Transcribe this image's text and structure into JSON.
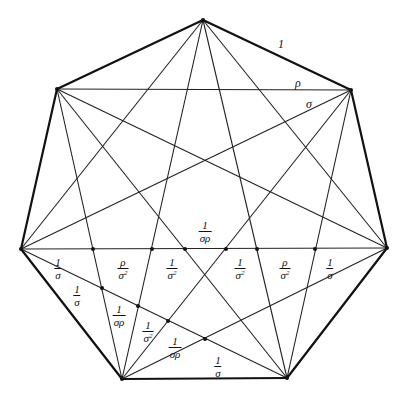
{
  "diagram": {
    "vertices": [
      {
        "id": "top",
        "x": 203,
        "y": 20
      },
      {
        "id": "upper-right",
        "x": 351,
        "y": 90
      },
      {
        "id": "right",
        "x": 387,
        "y": 248
      },
      {
        "id": "bottom-right",
        "x": 287,
        "y": 378
      },
      {
        "id": "bottom-left",
        "x": 122,
        "y": 379
      },
      {
        "id": "left",
        "x": 21,
        "y": 249
      },
      {
        "id": "upper-left",
        "x": 57,
        "y": 89
      }
    ],
    "intersection_dots": [
      {
        "x": 93,
        "y": 249
      },
      {
        "x": 152,
        "y": 249
      },
      {
        "x": 185,
        "y": 249
      },
      {
        "x": 226,
        "y": 249
      },
      {
        "x": 257,
        "y": 249
      },
      {
        "x": 315,
        "y": 249
      },
      {
        "x": 102,
        "y": 288
      },
      {
        "x": 138,
        "y": 306
      },
      {
        "x": 168,
        "y": 321
      },
      {
        "x": 205,
        "y": 339
      }
    ],
    "edge_labels": {
      "side": "1",
      "short_diagonal": "ρ",
      "long_diagonal": "σ"
    },
    "segment_labels_horizontal": [
      {
        "num": "1",
        "den": "σ",
        "exp": "",
        "x": 58,
        "y": 268
      },
      {
        "num": "ρ",
        "den": "σ",
        "exp": "2",
        "x": 123,
        "y": 268
      },
      {
        "num": "1",
        "den": "σ",
        "exp": "2",
        "x": 172,
        "y": 268
      },
      {
        "num": "1",
        "den": "σρ",
        "exp": "",
        "x": 205,
        "y": 231
      },
      {
        "num": "1",
        "den": "σ",
        "exp": "2",
        "x": 240,
        "y": 268
      },
      {
        "num": "ρ",
        "den": "σ",
        "exp": "2",
        "x": 285,
        "y": 268
      },
      {
        "num": "1",
        "den": "σ",
        "exp": "",
        "x": 330,
        "y": 268
      }
    ],
    "segment_labels_diagonal": [
      {
        "num": "1",
        "den": "σ",
        "exp": "",
        "x": 77,
        "y": 295
      },
      {
        "num": "1",
        "den": "σρ",
        "exp": "",
        "x": 119,
        "y": 315
      },
      {
        "num": "1",
        "den": "σ",
        "exp": "2",
        "x": 148,
        "y": 331
      },
      {
        "num": "1",
        "den": "σρ",
        "exp": "",
        "x": 175,
        "y": 347
      },
      {
        "num": "1",
        "den": "σ",
        "exp": "",
        "x": 218,
        "y": 366
      }
    ]
  }
}
